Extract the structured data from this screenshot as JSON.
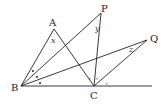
{
  "diagram": {
    "type": "geometry",
    "points": {
      "A": {
        "label": "A",
        "x": 54,
        "y": 29
      },
      "P": {
        "label": "P",
        "x": 101,
        "y": 13
      },
      "Q": {
        "label": "Q",
        "x": 147,
        "y": 40
      },
      "B": {
        "label": "B",
        "x": 21,
        "y": 86
      },
      "C": {
        "label": "C",
        "x": 94,
        "y": 86
      }
    },
    "angles": {
      "x": {
        "label": "x",
        "at": "A"
      },
      "y": {
        "label": "y",
        "at": "P"
      },
      "z": {
        "label": "z",
        "at": "Q"
      }
    },
    "segments": [
      "BA",
      "AC",
      "BP",
      "PC",
      "BQ",
      "QC",
      "BC-extended"
    ],
    "markers": {
      "angle_B_dots": "•",
      "angle_C_ticks": "×"
    }
  }
}
